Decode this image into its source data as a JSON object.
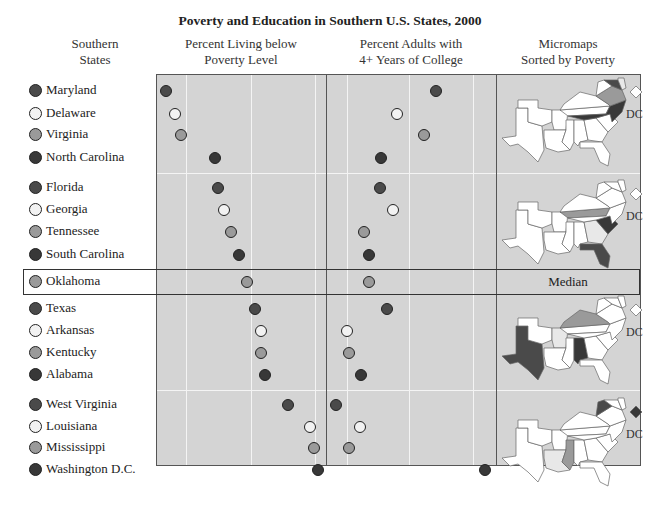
{
  "title": "Poverty and Education in Southern U.S. States, 2000",
  "columns": {
    "states": [
      "Southern",
      "States"
    ],
    "poverty": [
      "Percent Living below",
      "Poverty Level"
    ],
    "college": [
      "Percent Adults with",
      "4+ Years of College"
    ],
    "maps": [
      "Micromaps",
      "Sorted by Poverty"
    ]
  },
  "median_label": "Median",
  "dc_label": "DC",
  "colors": {
    "dark": "#4a4a4a",
    "white": "#f2f2f2",
    "medium": "#9a9a9a",
    "darkest": "#383838",
    "panel_bg": "#d4d4d4"
  },
  "chart_data": {
    "type": "scatter",
    "title": "Poverty and Education in Southern U.S. States, 2000",
    "subtitle": "Linked micromap plot",
    "categories": [
      "Maryland",
      "Delaware",
      "Virginia",
      "North Carolina",
      "Florida",
      "Georgia",
      "Tennessee",
      "South Carolina",
      "Oklahoma",
      "Texas",
      "Arkansas",
      "Kentucky",
      "Alabama",
      "West Virginia",
      "Louisiana",
      "Mississippi",
      "Washington D.C."
    ],
    "groups": [
      [
        "Maryland",
        "Delaware",
        "Virginia",
        "North Carolina"
      ],
      [
        "Florida",
        "Georgia",
        "Tennessee",
        "South Carolina"
      ],
      [
        "Oklahoma"
      ],
      [
        "Texas",
        "Arkansas",
        "Kentucky",
        "Alabama"
      ],
      [
        "West Virginia",
        "Louisiana",
        "Mississippi",
        "Washington D.C."
      ]
    ],
    "series": [
      {
        "name": "Percent Living below Poverty Level",
        "values": [
          8.5,
          9.2,
          9.6,
          12.3,
          12.5,
          13.0,
          13.5,
          14.1,
          14.7,
          15.4,
          15.8,
          15.8,
          16.1,
          17.9,
          19.6,
          19.9,
          20.2
        ]
      },
      {
        "name": "Percent Adults with 4+ Years of College",
        "values": [
          31.4,
          25.0,
          29.5,
          22.5,
          22.3,
          24.3,
          19.6,
          20.4,
          20.3,
          23.2,
          16.7,
          17.1,
          19.0,
          14.8,
          18.7,
          16.9,
          39.1
        ]
      }
    ],
    "dot_shades": [
      "dark",
      "white",
      "medium",
      "darkest",
      "dark",
      "white",
      "medium",
      "darkest",
      "medium",
      "dark",
      "white",
      "medium",
      "darkest",
      "dark",
      "white",
      "medium",
      "darkest"
    ],
    "xlabel": "",
    "ylabel": "",
    "axis_ticks": "none shown",
    "grid": true,
    "median_row": "Oklahoma",
    "sort": "by poverty, ascending"
  },
  "rows": [
    {
      "name": "Maryland",
      "shade": "dark",
      "y": 91,
      "px": 166,
      "cx": 436
    },
    {
      "name": "Delaware",
      "shade": "white",
      "y": 114,
      "px": 175,
      "cx": 397
    },
    {
      "name": "Virginia",
      "shade": "medium",
      "y": 135,
      "px": 181,
      "cx": 424
    },
    {
      "name": "North Carolina",
      "shade": "darkest",
      "y": 158,
      "px": 215,
      "cx": 381
    },
    {
      "name": "Florida",
      "shade": "dark",
      "y": 188,
      "px": 218,
      "cx": 380
    },
    {
      "name": "Georgia",
      "shade": "white",
      "y": 210,
      "px": 224,
      "cx": 393
    },
    {
      "name": "Tennessee",
      "shade": "medium",
      "y": 232,
      "px": 231,
      "cx": 364
    },
    {
      "name": "South Carolina",
      "shade": "darkest",
      "y": 255,
      "px": 239,
      "cx": 369
    },
    {
      "name": "Oklahoma",
      "shade": "medium",
      "y": 282,
      "px": 247,
      "cx": 369
    },
    {
      "name": "Texas",
      "shade": "dark",
      "y": 309,
      "px": 255,
      "cx": 387
    },
    {
      "name": "Arkansas",
      "shade": "white",
      "y": 331,
      "px": 261,
      "cx": 347
    },
    {
      "name": "Kentucky",
      "shade": "medium",
      "y": 353,
      "px": 261,
      "cx": 349
    },
    {
      "name": "Alabama",
      "shade": "darkest",
      "y": 375,
      "px": 265,
      "cx": 361
    },
    {
      "name": "West Virginia",
      "shade": "dark",
      "y": 405,
      "px": 288,
      "cx": 336
    },
    {
      "name": "Louisiana",
      "shade": "white",
      "y": 427,
      "px": 310,
      "cx": 360
    },
    {
      "name": "Mississippi",
      "shade": "medium",
      "y": 448,
      "px": 314,
      "cx": 349
    },
    {
      "name": "Washington D.C.",
      "shade": "darkest",
      "y": 470,
      "px": 318,
      "cx": 485
    }
  ]
}
